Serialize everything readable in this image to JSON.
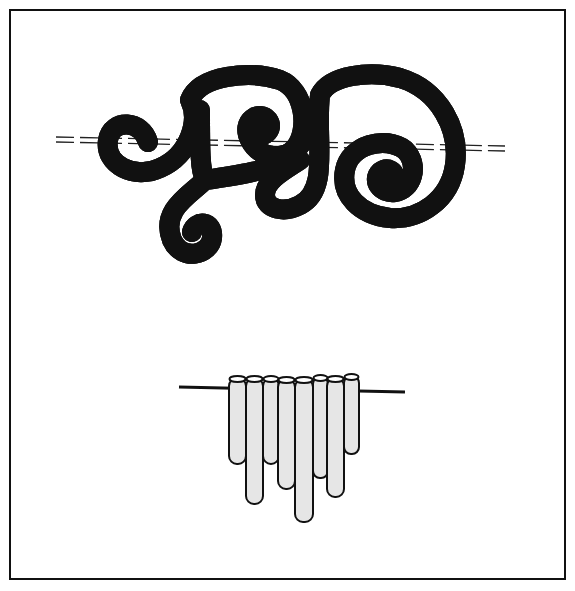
{
  "illustration": {
    "title": "",
    "figures": [
      {
        "name": "spiral-wire-ornament",
        "description": "Continuous coiled tube forming scroll spirals threaded on a dashed wire"
      },
      {
        "name": "tube-chime-row",
        "description": "Eight vertical tubes of varying lengths hanging on a horizontal rod"
      }
    ],
    "tube_lengths": [
      88,
      128,
      88,
      112,
      145,
      102,
      122,
      78
    ],
    "colors": {
      "ink": "#111111",
      "fill": "#d9d9d9",
      "shade": "#bdbdbd",
      "paper": "#ffffff"
    }
  }
}
